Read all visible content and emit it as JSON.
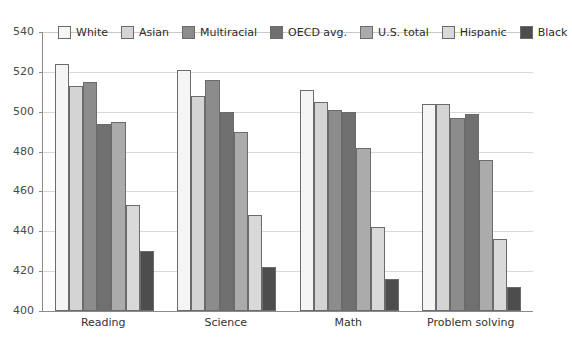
{
  "chart_data": {
    "type": "bar",
    "title": "",
    "subtitle": "",
    "xlabel": "",
    "ylabel": "",
    "categories": [
      "Reading",
      "Science",
      "Math",
      "Problem solving"
    ],
    "series": [
      {
        "name": "White",
        "color": "#f5f5f5",
        "values": [
          524,
          521,
          511,
          504
        ]
      },
      {
        "name": "Asian",
        "color": "#d4d4d4",
        "values": [
          513,
          508,
          505,
          504
        ]
      },
      {
        "name": "Multiracial",
        "color": "#8c8c8c",
        "values": [
          515,
          516,
          501,
          497
        ]
      },
      {
        "name": "OECD avg.",
        "color": "#707070",
        "values": [
          494,
          500,
          500,
          499
        ]
      },
      {
        "name": "U.S. total",
        "color": "#ababab",
        "values": [
          495,
          490,
          482,
          476
        ]
      },
      {
        "name": "Hispanic",
        "color": "#d9d9d9",
        "values": [
          453,
          448,
          442,
          436
        ]
      },
      {
        "name": "Black",
        "color": "#4d4d4d",
        "values": [
          430,
          422,
          416,
          412
        ]
      }
    ],
    "ylim": [
      400,
      540
    ],
    "ytick_step": 20,
    "yticks": [
      400,
      420,
      440,
      460,
      480,
      500,
      520,
      540
    ],
    "ytick_labels": [
      "400",
      "420",
      "440",
      "460",
      "480",
      "500",
      "520",
      "540"
    ],
    "grid": true,
    "grid_axis": "y",
    "legend_position": "top-inside",
    "bar_border_color": "#6b6b6b",
    "axis_color": "#8a8a8a",
    "gridline_color": "#d9d9d9",
    "background": "#ffffff"
  },
  "legend": {
    "items": [
      {
        "label": "White"
      },
      {
        "label": "Asian"
      },
      {
        "label": "Multiracial"
      },
      {
        "label": "OECD avg."
      },
      {
        "label": "U.S. total"
      },
      {
        "label": "Hispanic"
      },
      {
        "label": "Black"
      }
    ]
  }
}
